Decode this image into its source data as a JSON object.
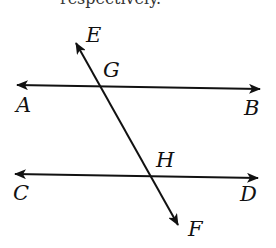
{
  "diagram": {
    "top_cut_text": "respectively.",
    "labels": {
      "E": "E",
      "F": "F",
      "G": "G",
      "H": "H",
      "A": "A",
      "B": "B",
      "C": "C",
      "D": "D"
    },
    "lines": [
      {
        "name": "AB",
        "from": [
          17,
          85
        ],
        "to": [
          260,
          89
        ],
        "arrows": "both"
      },
      {
        "name": "CD",
        "from": [
          15,
          174
        ],
        "to": [
          258,
          178
        ],
        "arrows": "both"
      },
      {
        "name": "EF",
        "from": [
          76,
          43
        ],
        "to": [
          178,
          225
        ],
        "arrows": "both"
      }
    ],
    "points": {
      "G": "intersection of EF and AB",
      "H": "intersection of EF and CD"
    },
    "colors": {
      "line": "#111111",
      "background": "#ffffff"
    }
  }
}
